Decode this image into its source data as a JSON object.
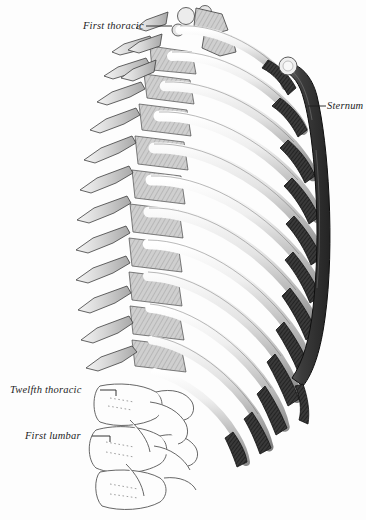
{
  "figure": {
    "view": "left lateral view of the thorax",
    "background_color": "#fdfdfd",
    "ink_color": "#1d1d1d",
    "bone_light_color": "#d9d9d9",
    "cartilage_dark_color": "#3a3a3a",
    "width": 366,
    "height": 520
  },
  "labels": {
    "first_thoracic": "First thoracic",
    "sternum": "Sternum",
    "twelfth_thoracic": "Twelfth thoracic",
    "first_lumbar": "First lumbar"
  },
  "structures": {
    "rib_count": 12,
    "vertebral_column": "thoracic and upper lumbar vertebrae",
    "sternum_parts": [
      "manubrium",
      "body",
      "xiphoid process"
    ],
    "costal_cartilages": "dark cross-hatched cartilages joining ribs to sternum"
  }
}
